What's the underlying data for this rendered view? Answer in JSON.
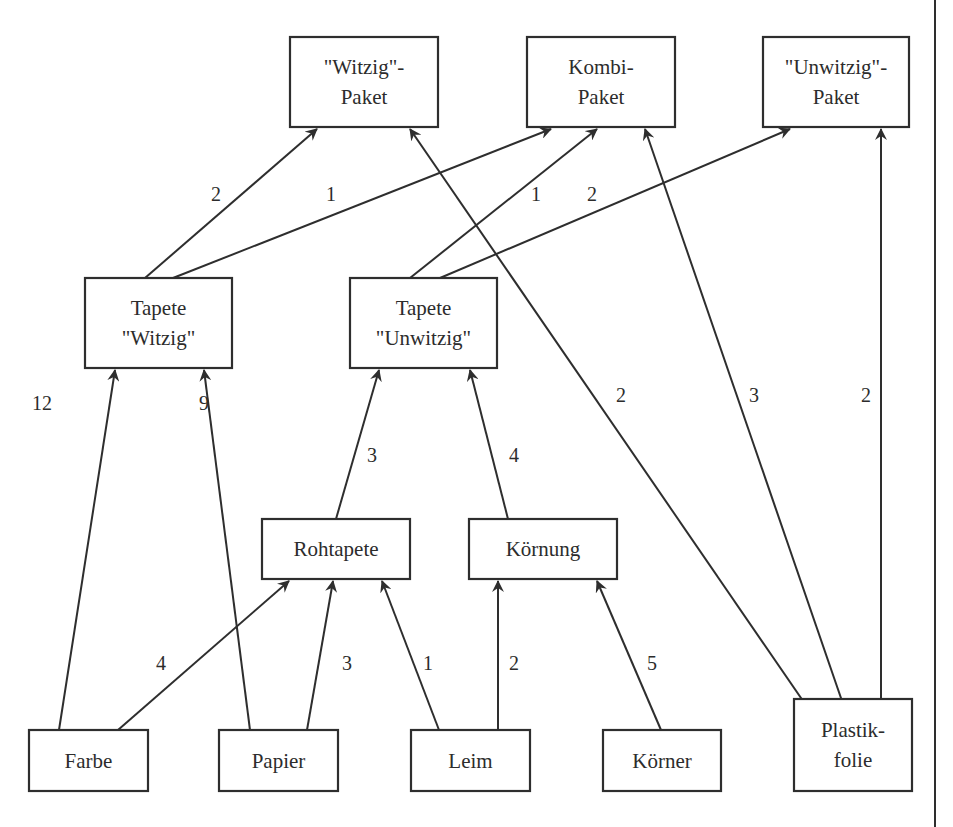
{
  "diagram": {
    "type": "bill-of-materials graph (Gozintograph)",
    "nodes": [
      {
        "id": "witzig_paket",
        "lines": [
          "\"Witzig\"-",
          "Paket"
        ]
      },
      {
        "id": "kombi_paket",
        "lines": [
          "Kombi-",
          "Paket"
        ]
      },
      {
        "id": "unwitzig_paket",
        "lines": [
          "\"Unwitzig\"-",
          "Paket"
        ]
      },
      {
        "id": "tapete_witzig",
        "lines": [
          "Tapete",
          "\"Witzig\""
        ]
      },
      {
        "id": "tapete_unwitzig",
        "lines": [
          "Tapete",
          "\"Unwitzig\""
        ]
      },
      {
        "id": "rohtapete",
        "lines": [
          "Rohtapete"
        ]
      },
      {
        "id": "koernung",
        "lines": [
          "Körnung"
        ]
      },
      {
        "id": "farbe",
        "lines": [
          "Farbe"
        ]
      },
      {
        "id": "papier",
        "lines": [
          "Papier"
        ]
      },
      {
        "id": "leim",
        "lines": [
          "Leim"
        ]
      },
      {
        "id": "koerner",
        "lines": [
          "Körner"
        ]
      },
      {
        "id": "plastikfolie",
        "lines": [
          "Plastik-",
          "folie"
        ]
      }
    ],
    "edges": [
      {
        "from": "tapete_witzig",
        "to": "witzig_paket",
        "label": "2"
      },
      {
        "from": "tapete_witzig",
        "to": "kombi_paket",
        "label": "1"
      },
      {
        "from": "tapete_unwitzig",
        "to": "kombi_paket",
        "label": "1"
      },
      {
        "from": "tapete_unwitzig",
        "to": "unwitzig_paket",
        "label": "2"
      },
      {
        "from": "plastikfolie",
        "to": "witzig_paket",
        "label": "2"
      },
      {
        "from": "plastikfolie",
        "to": "kombi_paket",
        "label": "3"
      },
      {
        "from": "plastikfolie",
        "to": "unwitzig_paket",
        "label": "2"
      },
      {
        "from": "farbe",
        "to": "tapete_witzig",
        "label": "12"
      },
      {
        "from": "papier",
        "to": "tapete_witzig",
        "label": "9"
      },
      {
        "from": "rohtapete",
        "to": "tapete_unwitzig",
        "label": "3"
      },
      {
        "from": "koernung",
        "to": "tapete_unwitzig",
        "label": "4"
      },
      {
        "from": "farbe",
        "to": "rohtapete",
        "label": "4"
      },
      {
        "from": "papier",
        "to": "rohtapete",
        "label": "3"
      },
      {
        "from": "leim",
        "to": "rohtapete",
        "label": "1"
      },
      {
        "from": "leim",
        "to": "koernung",
        "label": "2"
      },
      {
        "from": "koerner",
        "to": "koernung",
        "label": "5"
      }
    ]
  }
}
